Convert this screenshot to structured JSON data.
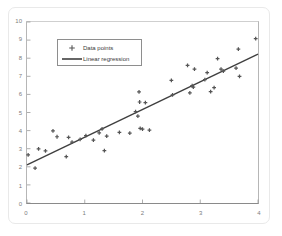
{
  "chart_data": {
    "type": "scatter",
    "title": "",
    "xlabel": "",
    "ylabel": "",
    "xlim": [
      0,
      4
    ],
    "ylim": [
      0,
      10
    ],
    "xticks": [
      0,
      1,
      2,
      3,
      4
    ],
    "yticks": [
      0,
      1,
      2,
      3,
      4,
      5,
      6,
      7,
      8,
      9,
      10
    ],
    "grid": false,
    "legend_position": "upper left",
    "marker_color": "#555555",
    "line_color": "#3f3f3f",
    "axis_color": "#8a8a8a",
    "tick_label_color": "#7d7d7d",
    "series": [
      {
        "name": "Data points",
        "type": "scatter",
        "marker": "plus",
        "points": [
          [
            0.02,
            2.66
          ],
          [
            0.14,
            1.93
          ],
          [
            0.2,
            2.99
          ],
          [
            0.32,
            2.88
          ],
          [
            0.45,
            3.99
          ],
          [
            0.52,
            3.66
          ],
          [
            0.68,
            2.56
          ],
          [
            0.72,
            3.62
          ],
          [
            0.78,
            3.36
          ],
          [
            0.92,
            3.52
          ],
          [
            1.02,
            3.72
          ],
          [
            1.15,
            3.47
          ],
          [
            1.25,
            3.88
          ],
          [
            1.3,
            4.09
          ],
          [
            1.34,
            2.9
          ],
          [
            1.38,
            3.7
          ],
          [
            1.6,
            3.9
          ],
          [
            1.78,
            3.86
          ],
          [
            1.88,
            5.05
          ],
          [
            1.92,
            4.8
          ],
          [
            1.94,
            6.14
          ],
          [
            1.95,
            5.58
          ],
          [
            1.96,
            4.12
          ],
          [
            2.0,
            4.08
          ],
          [
            2.05,
            5.55
          ],
          [
            2.12,
            4.02
          ],
          [
            2.5,
            6.78
          ],
          [
            2.52,
            5.98
          ],
          [
            2.78,
            7.6
          ],
          [
            2.82,
            6.08
          ],
          [
            2.86,
            6.48
          ],
          [
            2.88,
            6.4
          ],
          [
            2.9,
            7.4
          ],
          [
            3.08,
            6.82
          ],
          [
            3.12,
            7.2
          ],
          [
            3.18,
            6.15
          ],
          [
            3.24,
            6.38
          ],
          [
            3.3,
            7.98
          ],
          [
            3.36,
            7.4
          ],
          [
            3.4,
            7.28
          ],
          [
            3.62,
            7.45
          ],
          [
            3.66,
            8.5
          ],
          [
            3.68,
            7.0
          ],
          [
            3.96,
            9.08
          ]
        ]
      },
      {
        "name": "Linear regression",
        "type": "line",
        "endpoints": [
          [
            0,
            2.1
          ],
          [
            4,
            8.22
          ]
        ],
        "slope": 1.53,
        "intercept": 2.1
      }
    ]
  },
  "legend": {
    "items": [
      {
        "label": "Data points",
        "key": "marker"
      },
      {
        "label": "Linear regression",
        "key": "line"
      }
    ]
  },
  "axes": {
    "y_tick_labels": [
      "10",
      "9",
      "8",
      "7",
      "6",
      "5",
      "4",
      "3",
      "2",
      "1",
      "0"
    ],
    "x_tick_labels": [
      "0",
      "1",
      "2",
      "3",
      "4"
    ]
  }
}
